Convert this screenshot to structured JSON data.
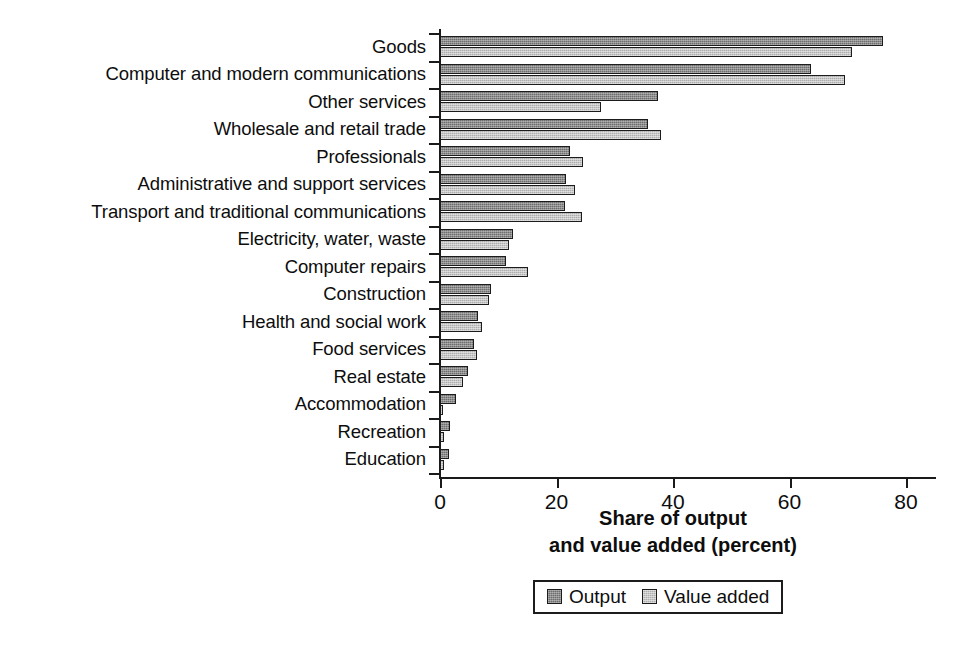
{
  "chart_data": {
    "type": "bar",
    "orientation": "horizontal",
    "title": "",
    "xlabel": "Share of output and value added (percent)",
    "xlabel_lines": [
      "Share of output",
      "and value added (percent)"
    ],
    "ylabel": "",
    "xlim": [
      0,
      80
    ],
    "xticks": [
      0,
      20,
      40,
      60,
      80
    ],
    "xticklabels": [
      "0",
      "20",
      "40",
      "60",
      "80"
    ],
    "grid": false,
    "legend_position": "bottom-center",
    "categories": [
      "Goods",
      "Computer and modern communications",
      "Other services",
      "Wholesale and retail trade",
      "Professionals",
      "Administrative and support services",
      "Transport and traditional communications",
      "Electricity, water, waste",
      "Computer repairs",
      "Construction",
      "Health and social work",
      "Food services",
      "Real estate",
      "Accommodation",
      "Recreation",
      "Education"
    ],
    "series": [
      {
        "name": "Output",
        "color": "#6d6d6d",
        "values": [
          76.1,
          63.7,
          37.5,
          35.7,
          22.3,
          21.6,
          21.4,
          12.5,
          11.3,
          8.8,
          6.5,
          5.8,
          4.8,
          2.7,
          1.7,
          1.6
        ]
      },
      {
        "name": "Value added",
        "color": "#adadad",
        "values": [
          70.7,
          69.5,
          27.6,
          37.9,
          24.5,
          23.2,
          24.4,
          11.8,
          15.1,
          8.4,
          7.2,
          6.4,
          4.0,
          0.6,
          0.7,
          0.7
        ]
      }
    ]
  },
  "legend": {
    "items": [
      {
        "label": "Output",
        "swatch": "output"
      },
      {
        "label": "Value added",
        "swatch": "valueadded"
      }
    ]
  }
}
